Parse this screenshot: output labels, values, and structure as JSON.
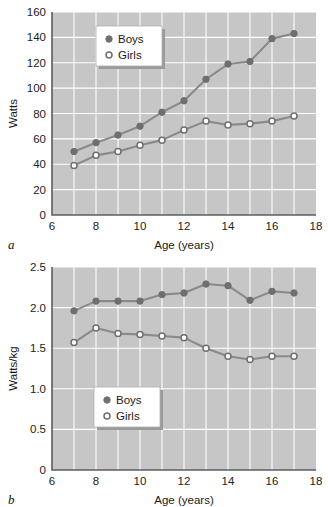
{
  "figure": {
    "panel_a_label": "a",
    "panel_b_label": "b"
  },
  "legend": {
    "boys": "Boys",
    "girls": "Girls",
    "boys_marker": "filled-circle",
    "girls_marker": "open-circle"
  },
  "colors": {
    "plot_background": "#c6c6c6",
    "gridline": "#ffffff",
    "axis": "#5d5d5d",
    "line": "#8a8a8a",
    "boys_marker_fill": "#6f6f6f",
    "girls_marker_fill": "#ffffff",
    "page_background": "#ffffff"
  },
  "chart_data": [
    {
      "type": "line",
      "panel": "a",
      "title": "",
      "xlabel": "Age (years)",
      "ylabel": "Watts",
      "xlim": [
        6,
        18
      ],
      "ylim": [
        0,
        160
      ],
      "xticks": [
        6,
        8,
        10,
        12,
        14,
        16,
        18
      ],
      "xtick_labels": [
        "6",
        "8",
        "10",
        "12",
        "14",
        "16",
        "18"
      ],
      "yticks": [
        0,
        20,
        40,
        60,
        80,
        100,
        120,
        140,
        160
      ],
      "ytick_labels": [
        "0",
        "20",
        "40",
        "60",
        "80",
        "100",
        "120",
        "140",
        "160"
      ],
      "x_minor_step": 1,
      "y_minor_step": 20,
      "grid": true,
      "legend_position": "upper-left-inside",
      "x": [
        7,
        8,
        9,
        10,
        11,
        12,
        13,
        14,
        15,
        16,
        17
      ],
      "series": [
        {
          "name": "Boys",
          "marker": "filled-circle",
          "values": [
            50,
            57,
            63,
            70,
            81,
            90,
            107,
            119,
            121,
            139,
            143
          ]
        },
        {
          "name": "Girls",
          "marker": "open-circle",
          "values": [
            39,
            47,
            50,
            55,
            59,
            67,
            74,
            71,
            72,
            74,
            78
          ]
        }
      ]
    },
    {
      "type": "line",
      "panel": "b",
      "title": "",
      "xlabel": "Age (years)",
      "ylabel": "Watts/kg",
      "xlim": [
        6,
        18
      ],
      "ylim": [
        0,
        2.5
      ],
      "xticks": [
        6,
        8,
        10,
        12,
        14,
        16,
        18
      ],
      "xtick_labels": [
        "6",
        "8",
        "10",
        "12",
        "14",
        "16",
        "18"
      ],
      "yticks": [
        0,
        0.5,
        1.0,
        1.5,
        2.0,
        2.5
      ],
      "ytick_labels": [
        "0",
        "0.5",
        "1.0",
        "1.5",
        "2.0",
        "2.5"
      ],
      "x_minor_step": 1,
      "y_minor_step": 0.5,
      "grid": true,
      "legend_position": "lower-left-inside",
      "x": [
        7,
        8,
        9,
        10,
        11,
        12,
        13,
        14,
        15,
        16,
        17
      ],
      "series": [
        {
          "name": "Boys",
          "marker": "filled-circle",
          "values": [
            1.96,
            2.08,
            2.08,
            2.08,
            2.16,
            2.18,
            2.29,
            2.27,
            2.09,
            2.2,
            2.18
          ]
        },
        {
          "name": "Girls",
          "marker": "open-circle",
          "values": [
            1.57,
            1.75,
            1.68,
            1.67,
            1.65,
            1.63,
            1.5,
            1.4,
            1.36,
            1.4,
            1.4
          ]
        }
      ]
    }
  ]
}
